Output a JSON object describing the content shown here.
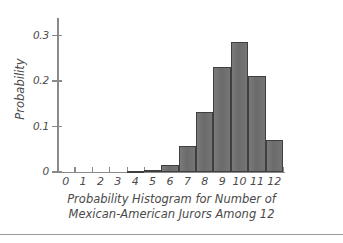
{
  "chart_data": {
    "type": "bar",
    "title": "Probability Histogram for Number of Mexican-American Jurors Among 12",
    "title_lines": [
      "Probability Histogram for Number of",
      "Mexican-American Jurors Among 12"
    ],
    "xlabel": "",
    "ylabel": "Probability",
    "categories": [
      "0",
      "1",
      "2",
      "3",
      "4",
      "5",
      "6",
      "7",
      "8",
      "9",
      "10",
      "11",
      "12"
    ],
    "values": [
      0,
      0,
      0,
      0,
      0.002,
      0.005,
      0.016,
      0.057,
      0.133,
      0.231,
      0.286,
      0.211,
      0.071
    ],
    "ylim": [
      0,
      0.33
    ],
    "xlim": [
      -0.5,
      12.5
    ],
    "y_ticks": [
      0,
      0.1,
      0.2,
      0.3
    ],
    "y_tick_labels": [
      "0",
      "0.1",
      "0.2",
      "0.3"
    ],
    "grid": false,
    "legend": false,
    "bar_color": "#6e6e6e",
    "bar_edge_color": "#3f3f3f",
    "axis_color": "#8a8a8a",
    "text_color": "#4a4a4a"
  }
}
